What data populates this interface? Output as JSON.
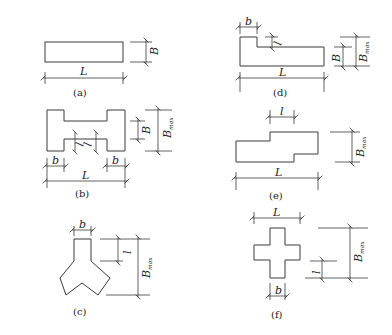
{
  "figures": [
    {
      "id": "a",
      "caption": "(a)",
      "labels": {
        "length": "L",
        "width": "B"
      }
    },
    {
      "id": "b",
      "caption": "(b)",
      "labels": {
        "length": "L",
        "width": "B",
        "max_width": "B",
        "max_sub": "max",
        "flange": "b",
        "step": "l"
      }
    },
    {
      "id": "c",
      "caption": "(c)",
      "labels": {
        "width": "b",
        "step": "l",
        "max_width": "B",
        "max_sub": "max"
      }
    },
    {
      "id": "d",
      "caption": "(d)",
      "labels": {
        "length": "L",
        "width": "B",
        "max_width": "B",
        "max_sub": "max",
        "flange": "b",
        "step": "l"
      }
    },
    {
      "id": "e",
      "caption": "(e)",
      "labels": {
        "length": "L",
        "step": "l",
        "max_width": "B",
        "max_sub": "max"
      }
    },
    {
      "id": "f",
      "caption": "(f)",
      "labels": {
        "length": "L",
        "width": "b",
        "step": "l",
        "max_width": "B",
        "max_sub": "max"
      }
    }
  ],
  "colors": {
    "line": "#3a3a3a",
    "background": "#ffffff"
  }
}
